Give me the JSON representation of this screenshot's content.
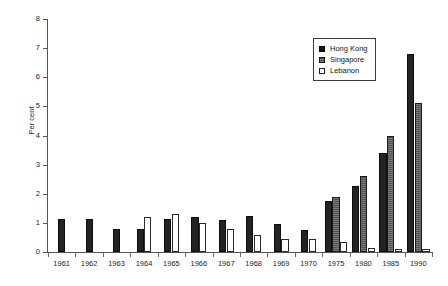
{
  "chart_data": {
    "type": "bar",
    "title": "",
    "subtitle": "",
    "xlabel": "",
    "ylabel": "Per cent",
    "ylim": [
      0,
      8
    ],
    "ytick_labels": [
      "0",
      "1",
      "2",
      "3",
      "4",
      "5",
      "6",
      "7",
      "8"
    ],
    "ytick_values": [
      0,
      1,
      2,
      3,
      4,
      5,
      6,
      7,
      8
    ],
    "grid": false,
    "legend_position": "top-right",
    "categories": [
      "1961",
      "1962",
      "1963",
      "1964",
      "1965",
      "1966",
      "1967",
      "1968",
      "1969",
      "1970",
      "1975",
      "1980",
      "1985",
      "1990"
    ],
    "series": [
      {
        "name": "Hong Kong",
        "color": "#232323",
        "values": [
          1.15,
          1.15,
          0.8,
          0.8,
          1.15,
          1.2,
          1.1,
          1.25,
          0.95,
          0.75,
          1.75,
          2.25,
          3.4,
          6.8
        ]
      },
      {
        "name": "Singapore",
        "color": "#5e5e5e",
        "values": [
          null,
          null,
          null,
          null,
          null,
          null,
          null,
          null,
          null,
          null,
          1.9,
          2.6,
          4.0,
          5.1
        ]
      },
      {
        "name": "Lebanon",
        "color": "#ffffff",
        "values": [
          null,
          null,
          null,
          1.2,
          1.3,
          1.0,
          0.8,
          0.6,
          0.45,
          0.45,
          0.35,
          0.15,
          0.1,
          0.1
        ]
      }
    ]
  },
  "legend": {
    "items": [
      {
        "label": "Hong Kong",
        "key": "hk"
      },
      {
        "label": "Singapore",
        "key": "sg"
      },
      {
        "label": "Lebanon",
        "key": "lb"
      }
    ]
  },
  "axes": {
    "y_title": "Per cent"
  }
}
